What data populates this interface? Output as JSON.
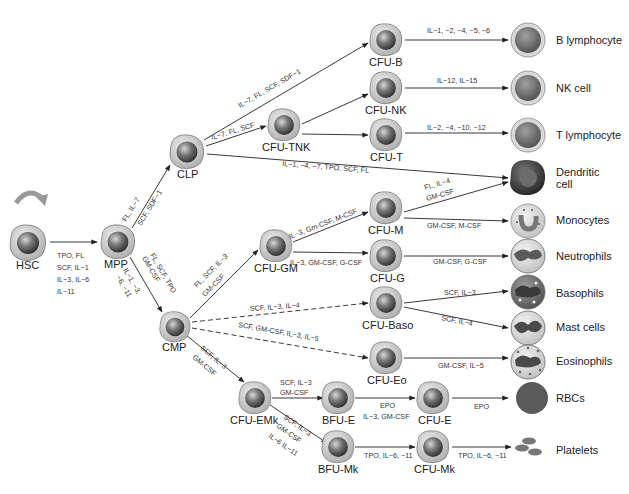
{
  "diagram": {
    "nodes": {
      "hsc": {
        "label": "HSC",
        "x": 28,
        "y": 243
      },
      "mpp": {
        "label": "MPP",
        "x": 118,
        "y": 242
      },
      "clp": {
        "label": "CLP",
        "x": 187,
        "y": 152
      },
      "cmp": {
        "label": "CMP",
        "x": 175,
        "y": 327
      },
      "cfu_b": {
        "label": "CFU-B",
        "x": 386,
        "y": 30
      },
      "cfu_nk": {
        "label": "CFU-NK",
        "x": 386,
        "y": 87
      },
      "cfu_tnk": {
        "label": "CFU-TNK",
        "x": 284,
        "y": 130
      },
      "cfu_t": {
        "label": "CFU-T",
        "x": 386,
        "y": 135
      },
      "cfu_gm": {
        "label": "CFU-GM",
        "x": 276,
        "y": 247
      },
      "cfu_m": {
        "label": "CFU-M",
        "x": 386,
        "y": 200
      },
      "cfu_g": {
        "label": "CFU-G",
        "x": 386,
        "y": 257
      },
      "cfu_baso": {
        "label": "CFU-Baso",
        "x": 386,
        "y": 303
      },
      "cfu_eo": {
        "label": "CFU-Eo",
        "x": 386,
        "y": 360
      },
      "cfu_emk": {
        "label": "CFU-EMk",
        "x": 255,
        "y": 398
      },
      "bfu_e": {
        "label": "BFU-E",
        "x": 338,
        "y": 398
      },
      "cfu_e": {
        "label": "CFU-E",
        "x": 431,
        "y": 398
      },
      "bfu_mk": {
        "label": "BFU-Mk",
        "x": 338,
        "y": 447
      },
      "cfu_mk": {
        "label": "CFU-Mk",
        "x": 431,
        "y": 447
      }
    },
    "finals": [
      {
        "id": "b_lymphocyte",
        "label": "B lymphocyte",
        "x": 528,
        "y": 42
      },
      {
        "id": "nk_cell",
        "label": "NK cell",
        "x": 528,
        "y": 89
      },
      {
        "id": "t_lymphocyte",
        "label": "T lymphocyte",
        "x": 528,
        "y": 135
      },
      {
        "id": "dendritic_cell",
        "label_line1": "Dendritic",
        "label_line2": "cell",
        "x": 528,
        "y": 178
      },
      {
        "id": "monocytes",
        "label": "Monocytes",
        "x": 528,
        "y": 220
      },
      {
        "id": "neutrophils",
        "label": "Neutrophils",
        "x": 528,
        "y": 256
      },
      {
        "id": "basophils",
        "label": "Basophils",
        "x": 528,
        "y": 293
      },
      {
        "id": "mast_cells",
        "label": "Mast cells",
        "x": 528,
        "y": 328
      },
      {
        "id": "eosinophils",
        "label": "Eosinophils",
        "x": 528,
        "y": 362
      },
      {
        "id": "rbcs",
        "label": "RBCs",
        "x": 532,
        "y": 399
      },
      {
        "id": "platelets",
        "label": "Platelets",
        "x": 528,
        "y": 450
      }
    ],
    "cytokines": {
      "hsc_mpp": [
        "TPO, FL",
        "SCF, IL−1",
        "IL−3, IL−6",
        "IL−11"
      ],
      "mpp_clp": [
        "FL, IL−7",
        "SCF, SDF−1"
      ],
      "mpp_cmp": [
        "FL, SCF, TPO",
        "GM-CSF",
        "IL−1, −3,",
        "−6, −11"
      ],
      "clp_cfu_b": "IL−7, FL, SCF, SDF−1",
      "clp_cfu_tnk": "IL−7, FL, SCF",
      "clp_dendritic": "IL−1, −4, −7, TPO, SCF, FL",
      "cfu_b_b": "IL−1, −2, −4, −5, −6",
      "cfu_nk_nk": "IL−12, IL−15",
      "cfu_t_t": "IL−2, −4, −10, −12",
      "cmp_cfu_gm": [
        "FL, SCF, IL−3",
        "GM-CSF"
      ],
      "cfu_gm_cfu_m": "IL−3, Gm-CSF, M-CSF",
      "cfu_gm_cfu_g": "IL−3, GM-CSF, G-CSF",
      "cfu_m_dendritic": [
        "FL, IL−4",
        "GM-CSF"
      ],
      "cfu_m_mono": "GM-CSF, M-CSF",
      "cfu_g_neut": "GM-CSF, G-CSF",
      "cmp_cfu_baso": "SCF, IL−3, IL−4",
      "cmp_cfu_eo": "SCF, GM-CSF, IL−3, IL−5",
      "cfu_baso_baso": "SCF, IL−3",
      "cfu_baso_mast": "SCF, IL−4",
      "cfu_eo_eo": "GM-CSF, IL−5",
      "cmp_cfu_emk": [
        "SCF, IL−3",
        "GM-CSF"
      ],
      "cfu_emk_bfu_e": [
        "SCF, IL−3",
        "GM-CSF"
      ],
      "cfu_emk_bfu_mk": [
        "SCF, IL−3",
        "GM-CSF",
        "IL−6 IL−11"
      ],
      "bfu_e_cfu_e": [
        "EPO",
        "IL−3, GM-CSF"
      ],
      "cfu_e_rbc": "EPO",
      "bfu_mk_cfu_mk": "TPO, IL−6, −11",
      "cfu_mk_plt": "TPO, IL−6, −11"
    },
    "colors": {
      "cell_cytoplasm": "#c9c9c9",
      "cell_nucleus": "#6a6a6a",
      "rbc": "#5a5a5a",
      "dendritic": "#4a4a4a",
      "line": "#222222",
      "self_renew_arrow": "#9a9a9a"
    }
  }
}
